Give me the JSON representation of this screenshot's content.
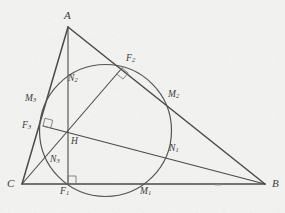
{
  "figure": {
    "background_color": "#f1f1ef",
    "stroke_color": "#4a4a4a",
    "circle_stroke_color": "#555555",
    "label_color": "#3a3a3a",
    "canvas": {
      "width": 285,
      "height": 213
    }
  },
  "vertices": [
    {
      "key": "A",
      "label": "A",
      "x": 68,
      "y": 27,
      "label_x": 64,
      "label_y": 10
    },
    {
      "key": "B",
      "label": "B",
      "x": 265,
      "y": 184,
      "label_x": 272,
      "label_y": 178
    },
    {
      "key": "C",
      "label": "C",
      "x": 22,
      "y": 184,
      "label_x": 7,
      "label_y": 178
    }
  ],
  "points": [
    {
      "key": "F1",
      "label": "F",
      "sub": "1",
      "role": "foot-of-altitude-from-A",
      "x": 68,
      "y": 184,
      "label_x": 60,
      "label_y": 187
    },
    {
      "key": "F2",
      "label": "F",
      "sub": "2",
      "role": "foot-of-altitude-from-C",
      "x": 122,
      "y": 68,
      "label_x": 126,
      "label_y": 54
    },
    {
      "key": "F3",
      "label": "F",
      "sub": "3",
      "role": "foot-of-altitude-from-B",
      "x": 43,
      "y": 126,
      "label_x": 22,
      "label_y": 121
    },
    {
      "key": "M1",
      "label": "M",
      "sub": "1",
      "role": "midpoint-of-CB",
      "x": 143,
      "y": 184,
      "label_x": 140,
      "label_y": 187
    },
    {
      "key": "M2",
      "label": "M",
      "sub": "2",
      "role": "midpoint-of-AB",
      "x": 166,
      "y": 105,
      "label_x": 168,
      "label_y": 90
    },
    {
      "key": "M3",
      "label": "M",
      "sub": "3",
      "role": "midpoint-of-CA",
      "x": 45,
      "y": 105,
      "label_x": 25,
      "label_y": 94
    },
    {
      "key": "N1",
      "label": "N",
      "sub": "1",
      "role": "euler-point-A-H",
      "x": 166,
      "y": 147,
      "label_x": 169,
      "label_y": 144
    },
    {
      "key": "N2",
      "label": "N",
      "sub": "2",
      "role": "euler-point-B-H",
      "x": 68,
      "y": 81,
      "label_x": 68,
      "label_y": 74
    },
    {
      "key": "N3",
      "label": "N",
      "sub": "3",
      "role": "euler-point-C-H",
      "x": 45,
      "y": 160,
      "label_x": 50,
      "label_y": 155
    },
    {
      "key": "H",
      "label": "H",
      "sub": "",
      "role": "orthocenter",
      "x": 68,
      "y": 135,
      "label_x": 71,
      "label_y": 137
    }
  ],
  "nine_point_circle": {
    "center_x": 105.5,
    "center_y": 130.5,
    "radius": 66.0
  },
  "segments": [
    {
      "name": "side-AB",
      "from": "A",
      "to": "B",
      "width": 1.5
    },
    {
      "name": "side-BC",
      "from": "B",
      "to": "C",
      "width": 1.5
    },
    {
      "name": "side-CA",
      "from": "C",
      "to": "A",
      "width": 1.5
    },
    {
      "name": "altitude-from-A",
      "from": "A",
      "to": "F1",
      "width": 1.1
    },
    {
      "name": "altitude-from-B",
      "from": "B",
      "to": "F3",
      "width": 1.1
    },
    {
      "name": "altitude-from-C",
      "from": "C",
      "to": "F2",
      "width": 1.1
    }
  ],
  "right_angle_marks": [
    {
      "name": "right-angle-at-F1",
      "at": "F1"
    },
    {
      "name": "right-angle-at-F2",
      "at": "F2"
    },
    {
      "name": "right-angle-at-F3",
      "at": "F3"
    }
  ],
  "tick_mark": {
    "name": "segment-tick-on-CB",
    "x": 218,
    "y": 185
  }
}
